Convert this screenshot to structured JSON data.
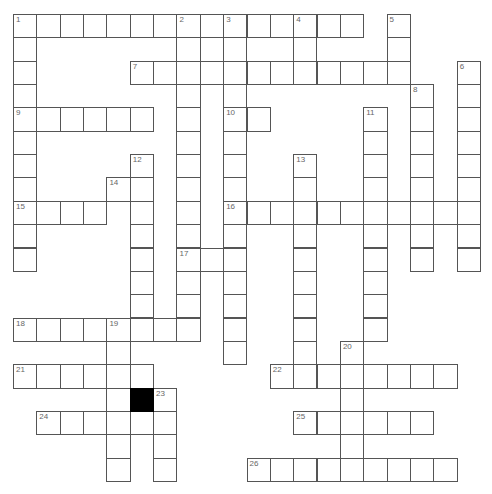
{
  "puzzle": {
    "cell_size": 23.35,
    "rows": 20,
    "cols": 20,
    "colors": {
      "border": "#555555",
      "number": "#666666",
      "block": "#000000",
      "background": "#ffffff"
    },
    "entries": [
      {
        "num": "1",
        "dir": "across",
        "row": 0,
        "col": 0,
        "len": 15
      },
      {
        "num": "1",
        "dir": "down",
        "row": 0,
        "col": 0,
        "len": 11
      },
      {
        "num": "2",
        "dir": "down",
        "row": 0,
        "col": 7,
        "len": 14
      },
      {
        "num": "3",
        "dir": "down",
        "row": 0,
        "col": 9,
        "len": 15
      },
      {
        "num": "4",
        "dir": "down",
        "row": 0,
        "col": 12,
        "len": 3
      },
      {
        "num": "5",
        "dir": "down",
        "row": 0,
        "col": 16,
        "len": 3
      },
      {
        "num": "6",
        "dir": "down",
        "row": 2,
        "col": 19,
        "len": 9
      },
      {
        "num": "7",
        "dir": "across",
        "row": 2,
        "col": 5,
        "len": 12
      },
      {
        "num": "8",
        "dir": "down",
        "row": 3,
        "col": 17,
        "len": 8
      },
      {
        "num": "9",
        "dir": "across",
        "row": 4,
        "col": 0,
        "len": 6
      },
      {
        "num": "10",
        "dir": "across",
        "row": 4,
        "col": 9,
        "len": 2
      },
      {
        "num": "11",
        "dir": "down",
        "row": 4,
        "col": 15,
        "len": 10
      },
      {
        "num": "12",
        "dir": "down",
        "row": 6,
        "col": 5,
        "len": 8
      },
      {
        "num": "13",
        "dir": "down",
        "row": 6,
        "col": 12,
        "len": 10
      },
      {
        "num": "14",
        "dir": "across",
        "row": 7,
        "col": 4,
        "len": 2
      },
      {
        "num": "15",
        "dir": "across",
        "row": 8,
        "col": 0,
        "len": 4
      },
      {
        "num": "16",
        "dir": "across",
        "row": 8,
        "col": 9,
        "len": 11
      },
      {
        "num": "17",
        "dir": "across",
        "row": 10,
        "col": 7,
        "len": 3
      },
      {
        "num": "18",
        "dir": "across",
        "row": 13,
        "col": 0,
        "len": 8
      },
      {
        "num": "19",
        "dir": "down",
        "row": 13,
        "col": 4,
        "len": 7
      },
      {
        "num": "20",
        "dir": "down",
        "row": 14,
        "col": 14,
        "len": 6
      },
      {
        "num": "21",
        "dir": "across",
        "row": 15,
        "col": 0,
        "len": 6
      },
      {
        "num": "22",
        "dir": "across",
        "row": 15,
        "col": 11,
        "len": 8
      },
      {
        "num": "23",
        "dir": "down",
        "row": 16,
        "col": 6,
        "len": 4
      },
      {
        "num": "24",
        "dir": "across",
        "row": 17,
        "col": 1,
        "len": 6
      },
      {
        "num": "25",
        "dir": "across",
        "row": 17,
        "col": 12,
        "len": 6
      },
      {
        "num": "26",
        "dir": "across",
        "row": 19,
        "col": 10,
        "len": 9
      }
    ],
    "black_cells": [
      {
        "row": 16,
        "col": 5
      }
    ]
  }
}
